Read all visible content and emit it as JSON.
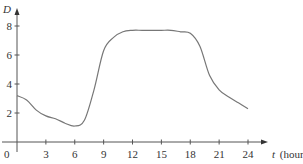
{
  "chart_data": {
    "type": "line",
    "title": "",
    "xlabel": "t (hours)",
    "xlabel_var": "t",
    "xlabel_unit": "(hours)",
    "ylabel": "D",
    "xlim": [
      0,
      24
    ],
    "ylim": [
      0,
      8
    ],
    "x_ticks": [
      3,
      6,
      9,
      12,
      15,
      18,
      21,
      24
    ],
    "y_ticks": [
      2,
      4,
      6,
      8
    ],
    "origin_label": "0",
    "grid": false,
    "legend": null,
    "series": [
      {
        "name": "D(t)",
        "x": [
          0,
          1,
          2,
          3,
          4,
          5,
          6,
          7,
          8,
          9,
          10,
          11,
          12,
          13,
          14,
          15,
          16,
          17,
          18,
          19,
          20,
          21,
          22,
          23,
          24
        ],
        "values": [
          3.2,
          2.9,
          2.2,
          1.8,
          1.6,
          1.3,
          1.1,
          1.5,
          3.6,
          6.3,
          7.2,
          7.6,
          7.7,
          7.7,
          7.7,
          7.7,
          7.7,
          7.6,
          7.5,
          6.6,
          4.6,
          3.6,
          3.1,
          2.7,
          2.3
        ]
      }
    ],
    "color": "#777777"
  }
}
